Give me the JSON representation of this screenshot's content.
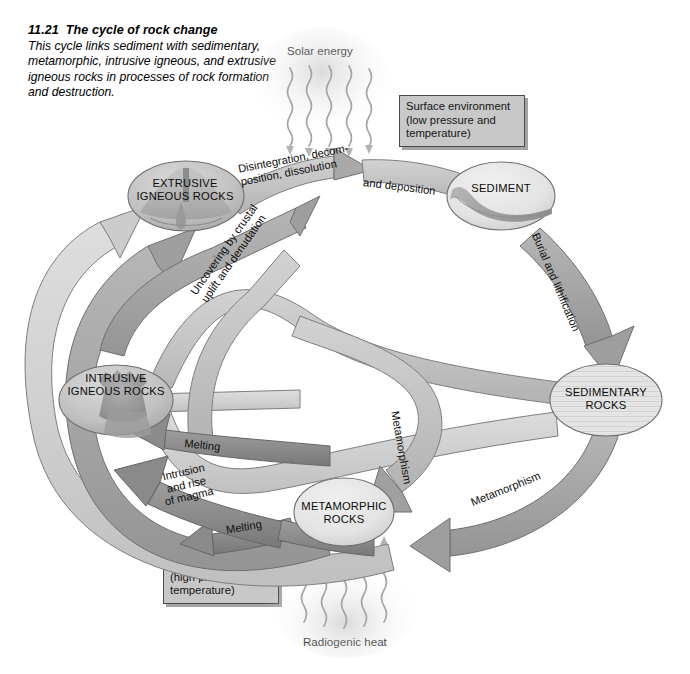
{
  "figure": {
    "number": "11.21",
    "title": "The cycle of rock change",
    "caption": "This cycle links sediment with sedimentary, metamorphic, intrusive igneous, and extrusive igneous rocks in processes of rock formation and destruction."
  },
  "energy": {
    "solar": "Solar energy",
    "radiogenic": "Radiogenic heat"
  },
  "boxes": {
    "surface": "Surface environment\n(low pressure and\ntemperature)",
    "deep": "Deep environment\n(high pressure and\ntemperature)"
  },
  "nodes": {
    "extrusive": "EXTRUSIVE\nIGNEOUS ROCKS",
    "sediment": "SEDIMENT",
    "sedimentary": "SEDIMENTARY\nROCKS",
    "metamorphic": "METAMORPHIC\nROCKS",
    "intrusive": "INTRUSIVE\nIGNEOUS ROCKS"
  },
  "processes": {
    "disintegration": "Disintegration, decom-\nposition, dissolution",
    "deposition": "and deposition",
    "burial": "Burial and lithification",
    "metamorphism_sed": "Metamorphism",
    "metamorphism_mid": "Metamorphism",
    "melting_left": "Melting",
    "melting_bottom": "Melting",
    "intrusion": "Intrusion\nand rise\nof magma",
    "uncovering": "Uncovering by crustal\nuplift and denudation"
  },
  "colors": {
    "arrow_dark": "#8d8d8d",
    "arrow_mid": "#a8a8a8",
    "arrow_light": "#c4c4c4",
    "arrow_pale": "#d5d5d5",
    "node_fill": "#e2e2e2",
    "box_fill": "#c8c8c8",
    "stroke": "#5a5a5a",
    "text": "#101010"
  }
}
